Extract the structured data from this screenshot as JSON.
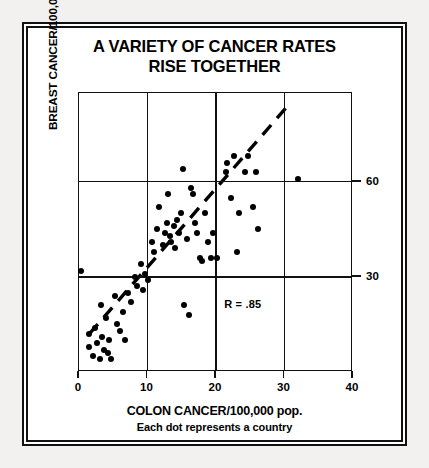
{
  "chart_data": {
    "type": "scatter",
    "title": "A VARIETY OF CANCER RATES RISE TOGETHER",
    "title_line1": "A VARIETY OF CANCER RATES",
    "title_line2": "RISE TOGETHER",
    "xlabel": "COLON CANCER/100,000 pop.",
    "caption": "Each dot represents a country",
    "ylabel": "BREAST CANCER/100,000 pop.",
    "annotation": "R = .85",
    "correlation": 0.85,
    "xlim": [
      0,
      40
    ],
    "ylim": [
      0,
      88
    ],
    "xticks": [
      0,
      10,
      20,
      30,
      40
    ],
    "xtick_labels": [
      "0",
      "10",
      "20",
      "30",
      "40"
    ],
    "yticks": [
      30,
      60
    ],
    "ytick_labels": [
      "30",
      "60"
    ],
    "ytick_side": "right",
    "grid": true,
    "grid_x": [
      10,
      20,
      30
    ],
    "grid_y": [
      30,
      60
    ],
    "legend": "none",
    "marker_color": "#000000",
    "trendline": {
      "style": "dashed",
      "x_start": 1.5,
      "y_start": 12,
      "x_end": 30.5,
      "y_end": 84
    },
    "points": [
      {
        "x": 0.3,
        "y": 32
      },
      {
        "x": 1.4,
        "y": 12
      },
      {
        "x": 1.5,
        "y": 8
      },
      {
        "x": 2.1,
        "y": 5
      },
      {
        "x": 2.3,
        "y": 14
      },
      {
        "x": 2.6,
        "y": 9
      },
      {
        "x": 3.0,
        "y": 4
      },
      {
        "x": 3.2,
        "y": 21
      },
      {
        "x": 3.3,
        "y": 11
      },
      {
        "x": 3.6,
        "y": 7
      },
      {
        "x": 4.0,
        "y": 17
      },
      {
        "x": 4.2,
        "y": 6
      },
      {
        "x": 4.4,
        "y": 10
      },
      {
        "x": 4.6,
        "y": 4
      },
      {
        "x": 5.3,
        "y": 24
      },
      {
        "x": 5.6,
        "y": 15
      },
      {
        "x": 6.0,
        "y": 13
      },
      {
        "x": 6.4,
        "y": 19
      },
      {
        "x": 6.7,
        "y": 10
      },
      {
        "x": 7.2,
        "y": 25
      },
      {
        "x": 7.6,
        "y": 22
      },
      {
        "x": 8.2,
        "y": 30
      },
      {
        "x": 8.5,
        "y": 27
      },
      {
        "x": 9.0,
        "y": 34
      },
      {
        "x": 9.3,
        "y": 26
      },
      {
        "x": 9.6,
        "y": 31
      },
      {
        "x": 10.1,
        "y": 29
      },
      {
        "x": 10.6,
        "y": 41
      },
      {
        "x": 11.0,
        "y": 38
      },
      {
        "x": 11.4,
        "y": 45
      },
      {
        "x": 11.7,
        "y": 52
      },
      {
        "x": 12.2,
        "y": 40
      },
      {
        "x": 12.5,
        "y": 44
      },
      {
        "x": 12.8,
        "y": 47
      },
      {
        "x": 13.0,
        "y": 56
      },
      {
        "x": 13.3,
        "y": 43
      },
      {
        "x": 13.5,
        "y": 41
      },
      {
        "x": 13.8,
        "y": 46
      },
      {
        "x": 14.0,
        "y": 39
      },
      {
        "x": 14.3,
        "y": 48
      },
      {
        "x": 14.6,
        "y": 44
      },
      {
        "x": 14.9,
        "y": 50
      },
      {
        "x": 15.2,
        "y": 64
      },
      {
        "x": 15.4,
        "y": 21
      },
      {
        "x": 15.8,
        "y": 42
      },
      {
        "x": 16.0,
        "y": 18
      },
      {
        "x": 16.3,
        "y": 58
      },
      {
        "x": 16.6,
        "y": 56
      },
      {
        "x": 16.9,
        "y": 47
      },
      {
        "x": 17.2,
        "y": 44
      },
      {
        "x": 17.6,
        "y": 36
      },
      {
        "x": 18.0,
        "y": 35
      },
      {
        "x": 18.4,
        "y": 50
      },
      {
        "x": 18.8,
        "y": 41
      },
      {
        "x": 19.2,
        "y": 36
      },
      {
        "x": 19.6,
        "y": 44
      },
      {
        "x": 20.2,
        "y": 36
      },
      {
        "x": 21.4,
        "y": 63
      },
      {
        "x": 21.6,
        "y": 66
      },
      {
        "x": 22.2,
        "y": 55
      },
      {
        "x": 22.6,
        "y": 68
      },
      {
        "x": 23.0,
        "y": 38
      },
      {
        "x": 23.4,
        "y": 50
      },
      {
        "x": 24.2,
        "y": 63
      },
      {
        "x": 24.6,
        "y": 68
      },
      {
        "x": 25.4,
        "y": 52
      },
      {
        "x": 25.8,
        "y": 63
      },
      {
        "x": 26.2,
        "y": 45
      },
      {
        "x": 32.0,
        "y": 61
      }
    ]
  }
}
